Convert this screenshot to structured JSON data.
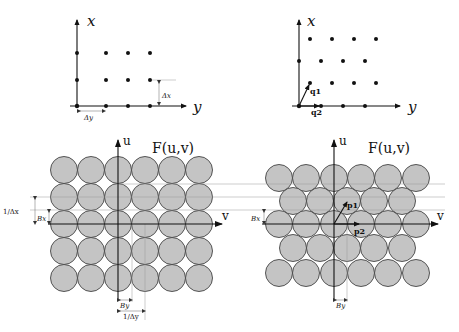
{
  "panels": {
    "top_left": {
      "x_axis_label": "x",
      "y_axis_label": "y",
      "delta_x_label": "Δx",
      "delta_y_label": "Δy",
      "lattice": "rectangular"
    },
    "top_right": {
      "x_axis_label": "x",
      "y_axis_label": "y",
      "q1_label": "q1",
      "q2_label": "q2",
      "lattice": "hexagonal"
    },
    "bottom_left": {
      "title": "F(u,v)",
      "u_axis_label": "u",
      "v_axis_label": "v",
      "inv_delta_x_label": "1/Δx",
      "bx_label": "Bx",
      "by_label": "By",
      "inv_delta_y_label": "1/Δy",
      "packing": "rectangular"
    },
    "bottom_right": {
      "title": "F(u,v)",
      "u_axis_label": "u",
      "v_axis_label": "v",
      "p1_label": "p1",
      "p2_label": "p2",
      "bx_label": "Bx",
      "by_label": "By",
      "packing": "hexagonal"
    }
  },
  "colors": {
    "circle_fill": "#c4c4c4",
    "circle_stroke": "#444444",
    "axis": "#111111"
  }
}
